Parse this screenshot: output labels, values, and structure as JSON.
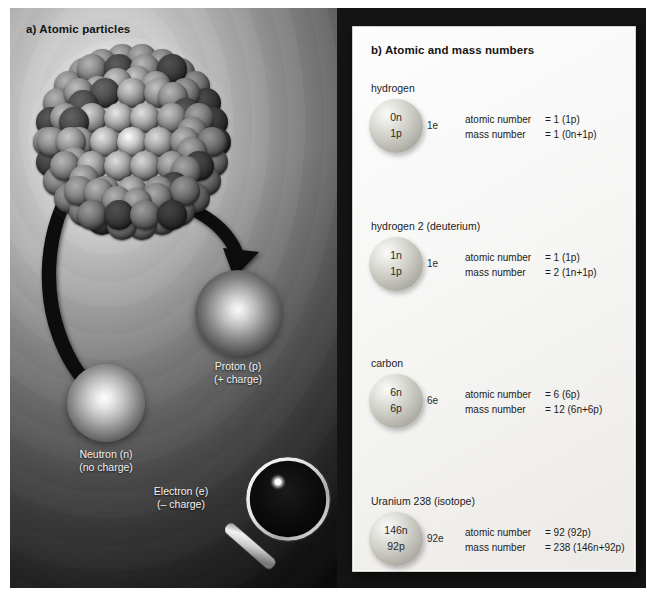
{
  "figure": {
    "panel_a": {
      "title": "a) Atomic particles",
      "nucleus_label": "nucleus-cluster",
      "particles": [
        {
          "name": "proton",
          "line1": "Proton (p)",
          "line2": "(+ charge)"
        },
        {
          "name": "neutron",
          "line1": "Neutron (n)",
          "line2": "(no charge)"
        },
        {
          "name": "electron",
          "line1": "Electron (e)",
          "line2": "(– charge)"
        }
      ],
      "magnifier_icon": "magnifying-glass-icon"
    },
    "panel_b": {
      "title": "b) Atomic and mass numbers",
      "rows": [
        {
          "element": "hydrogen",
          "neutrons": "0n",
          "protons": "1p",
          "electrons": "1e",
          "atomic_label": "atomic number",
          "atomic_value": "= 1 (1p)",
          "mass_label": "mass number",
          "mass_value": "= 1 (0n+1p)"
        },
        {
          "element": "hydrogen 2 (deuterium)",
          "neutrons": "1n",
          "protons": "1p",
          "electrons": "1e",
          "atomic_label": "atomic number",
          "atomic_value": "= 1 (1p)",
          "mass_label": "mass number",
          "mass_value": "= 2 (1n+1p)"
        },
        {
          "element": "carbon",
          "neutrons": "6n",
          "protons": "6p",
          "electrons": "6e",
          "atomic_label": "atomic number",
          "atomic_value": "= 6 (6p)",
          "mass_label": "mass number",
          "mass_value": "= 12 (6n+6p)"
        },
        {
          "element": "Uranium 238 (isotope)",
          "neutrons": "146n",
          "protons": "92p",
          "electrons": "92e",
          "atomic_label": "atomic number",
          "atomic_value": "= 92 (92p)",
          "mass_label": "mass number",
          "mass_value": "= 238 (146n+92p)"
        }
      ]
    },
    "colors": {
      "frame": "#141414",
      "card": "#f6f6f5",
      "text_dark": "#141414",
      "text_light": "#f2f2f2",
      "sphere_light": "#fafaf8",
      "sphere_dark": "#8b8b82"
    }
  }
}
